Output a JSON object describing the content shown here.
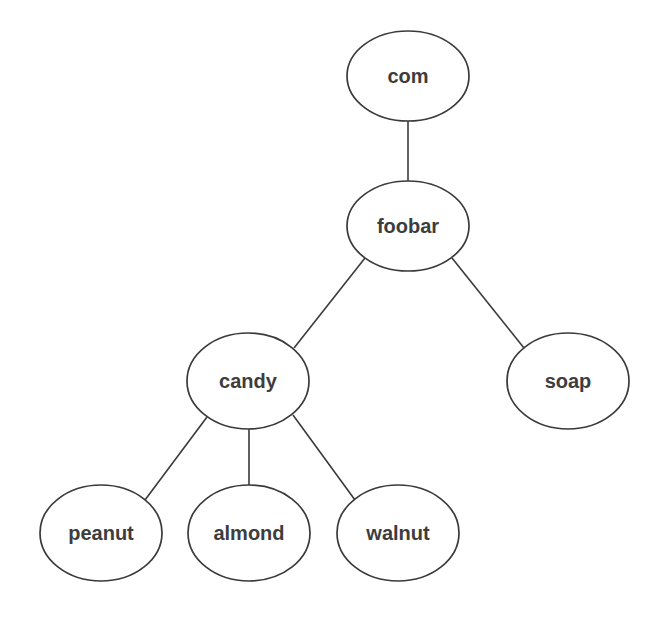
{
  "diagram": {
    "type": "tree",
    "nodes": [
      {
        "id": "com",
        "label": "com",
        "cx": 408,
        "cy": 76,
        "rx": 61,
        "ry": 45
      },
      {
        "id": "foobar",
        "label": "foobar",
        "cx": 408,
        "cy": 226,
        "rx": 61,
        "ry": 45
      },
      {
        "id": "candy",
        "label": "candy",
        "cx": 248,
        "cy": 381,
        "rx": 61,
        "ry": 48
      },
      {
        "id": "soap",
        "label": "soap",
        "cx": 568,
        "cy": 381,
        "rx": 61,
        "ry": 48
      },
      {
        "id": "peanut",
        "label": "peanut",
        "cx": 101,
        "cy": 533,
        "rx": 61,
        "ry": 48
      },
      {
        "id": "almond",
        "label": "almond",
        "cx": 249,
        "cy": 533,
        "rx": 61,
        "ry": 48
      },
      {
        "id": "walnut",
        "label": "walnut",
        "cx": 398,
        "cy": 533,
        "rx": 61,
        "ry": 48
      }
    ],
    "edges": [
      {
        "from": "com",
        "to": "foobar",
        "x1": 408,
        "y1": 121,
        "x2": 408,
        "y2": 181
      },
      {
        "from": "foobar",
        "to": "candy",
        "x1": 365,
        "y1": 258,
        "x2": 294,
        "y2": 348
      },
      {
        "from": "foobar",
        "to": "soap",
        "x1": 452,
        "y1": 258,
        "x2": 524,
        "y2": 348
      },
      {
        "from": "candy",
        "to": "peanut",
        "x1": 207,
        "y1": 417,
        "x2": 145,
        "y2": 500
      },
      {
        "from": "candy",
        "to": "almond",
        "x1": 249,
        "y1": 429,
        "x2": 249,
        "y2": 485
      },
      {
        "from": "candy",
        "to": "walnut",
        "x1": 293,
        "y1": 415,
        "x2": 355,
        "y2": 500
      }
    ]
  },
  "colors": {
    "background": "#ffffff",
    "stroke": "#3a3a3a",
    "text": "#3d3d3d"
  }
}
